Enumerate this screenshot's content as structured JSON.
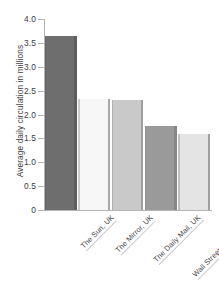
{
  "chart_data": {
    "type": "bar",
    "title": "",
    "subtitle": "",
    "xlabel": "",
    "ylabel": "Average daily circulation in millions",
    "ylim": [
      0,
      4.0
    ],
    "ytick_labels": [
      "4.0",
      "3.5",
      "3.0",
      "2.5",
      "2.0",
      "1.5",
      "1.0",
      "0.5",
      "0"
    ],
    "ytick_values": [
      4.0,
      3.5,
      3.0,
      2.5,
      2.0,
      1.5,
      1.0,
      0.5,
      0
    ],
    "grid": false,
    "legend": null,
    "categories": [
      "The Sun, UK",
      "The Mirror, UK",
      "The Daily Mail, UK",
      "Wall Street Journal, USA",
      "USA Today, USA"
    ],
    "values": [
      3.65,
      2.32,
      2.31,
      1.75,
      1.6
    ],
    "bar_colors": [
      "#6e6e6e",
      "#f7f7f7",
      "#c9c9c9",
      "#9a9a9a",
      "#e4e4e4"
    ],
    "bar_edge_colors": [
      "#5d5d5d",
      "#a9a9a9",
      "#9d9d9d",
      "#868686",
      "#a0a0a0"
    ],
    "axis_color": "#b4b4b4",
    "text_color": "#3c3c3c"
  }
}
